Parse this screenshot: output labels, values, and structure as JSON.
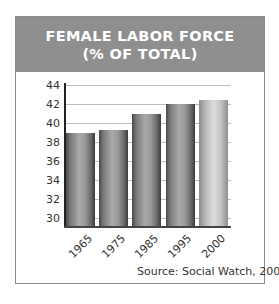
{
  "chart_data": {
    "type": "bar",
    "title": "FEMALE LABOR FORCE",
    "subtitle": "(% OF TOTAL)",
    "categories": [
      "1965",
      "1975",
      "1985",
      "1995",
      "2000"
    ],
    "values": [
      38.9,
      39.3,
      41.0,
      42.0,
      42.4
    ],
    "xlabel": "",
    "ylabel": "",
    "ylim": [
      30,
      44
    ],
    "yticks": [
      30,
      32,
      34,
      36,
      38,
      40,
      42,
      44
    ],
    "grid": true,
    "legend": null,
    "annotations": [
      "Source: Social Watch, 2003"
    ]
  },
  "header": {
    "title": "FEMALE LABOR FORCE",
    "subtitle": "(% OF TOTAL)"
  },
  "yticks": [
    "44",
    "42",
    "40",
    "38",
    "36",
    "34",
    "32",
    "30"
  ],
  "xlabels": [
    "1965",
    "1975",
    "1985",
    "1995",
    "2000"
  ],
  "source": "Source: Social Watch, 2003",
  "colors": {
    "header_bg": "#8f8f8f",
    "bar_dark": "#6d6d6d",
    "bar_light": "#c4c4c4",
    "gridline": "#bdbdbd"
  }
}
